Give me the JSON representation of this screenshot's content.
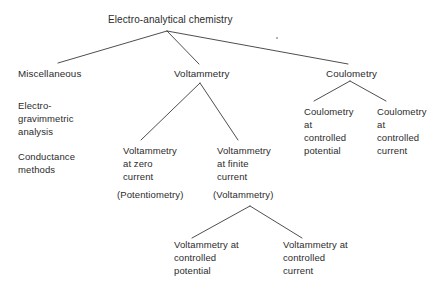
{
  "diagram": {
    "type": "hierarchy-tree",
    "title_node": "Electro-analytical chemistry",
    "line_color": "#3a3a3a",
    "text_color": "#2b2b2b",
    "background_color": "#ffffff",
    "levels": {
      "root": {
        "label": "Electro-analytical chemistry"
      },
      "level2": {
        "miscellaneous": "Miscellaneous",
        "voltammetry": "Voltammetry",
        "coulometry": "Coulometry"
      },
      "miscellaneous_items": {
        "item1_line1": "Electro-",
        "item1_line2": "gravimmetric",
        "item1_line3": "analysis",
        "item2_line1": "Conductance",
        "item2_line2": "methods"
      },
      "voltammetry_children": {
        "zero_current": {
          "line1": "Voltammetry",
          "line2": "at zero",
          "line3": "current",
          "paren": "(Potentiometry)"
        },
        "finite_current": {
          "line1": "Voltammetry",
          "line2": "at finite",
          "line3": "current",
          "paren": "(Voltammetry)"
        }
      },
      "finite_current_children": {
        "controlled_potential": {
          "line1": "Voltammetry at",
          "line2": "controlled",
          "line3": "potential"
        },
        "controlled_current": {
          "line1": "Voltammetry at",
          "line2": "controlled",
          "line3": "current"
        }
      },
      "coulometry_children": {
        "controlled_potential": {
          "line1": "Coulometry",
          "line2": "at",
          "line3": "controlled",
          "line4": "potential"
        },
        "controlled_current": {
          "line1": "Coulometry",
          "line2": "at",
          "line3": "controlled",
          "line4": "current"
        }
      }
    }
  }
}
